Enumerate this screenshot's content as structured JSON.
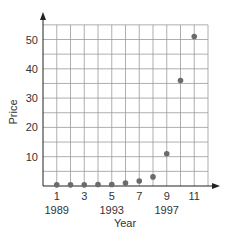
{
  "chart_data": {
    "type": "scatter",
    "title": "",
    "xlabel": "Year",
    "ylabel": "Price",
    "x": [
      1,
      2,
      3,
      4,
      5,
      6,
      7,
      8,
      9,
      10,
      11
    ],
    "values": [
      0.4,
      0.4,
      0.4,
      0.5,
      0.5,
      1.0,
      1.7,
      3.1,
      11,
      36,
      51
    ],
    "x_ticks": [
      1,
      3,
      5,
      7,
      9,
      11
    ],
    "x_year_labels": [
      {
        "x": 1,
        "label": "1989"
      },
      {
        "x": 5,
        "label": "1993"
      },
      {
        "x": 9,
        "label": "1997"
      }
    ],
    "y_ticks": [
      10,
      20,
      30,
      40,
      50
    ],
    "xlim": [
      0,
      12
    ],
    "ylim": [
      0,
      55
    ],
    "grid": true,
    "grid_step_x": 1,
    "grid_step_y": 5,
    "legend": null,
    "colors": {
      "point": "#6b6b6b",
      "grid": "#9a9a9a",
      "axis": "#222222"
    }
  }
}
